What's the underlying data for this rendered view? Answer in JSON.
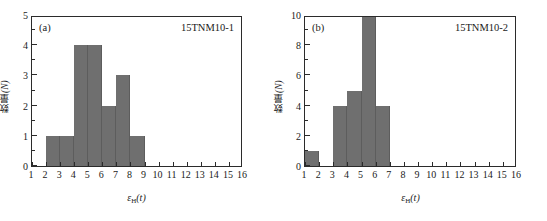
{
  "figure": {
    "background": "#ffffff",
    "bar_color": "#6f6f6f",
    "axis_color": "#2b2b2b"
  },
  "panels": [
    {
      "tag": "(a)",
      "sample_id": "15TNM10-1",
      "ylabel_cjk": "数量",
      "ylabel_unit": "(N)",
      "xlabel_symbol": "ε",
      "xlabel_sub": "H",
      "xlabel_arg": "(t)"
    },
    {
      "tag": "(b)",
      "sample_id": "15TNM10-2",
      "ylabel_cjk": "数量",
      "ylabel_unit": "(N)",
      "xlabel_symbol": "ε",
      "xlabel_sub": "H",
      "xlabel_arg": "(t)"
    }
  ],
  "chart_data": [
    {
      "type": "bar",
      "title": "15TNM10-1",
      "panel_label": "(a)",
      "xlabel": "εH(t)",
      "ylabel": "数量(N)",
      "xlim": [
        1,
        16
      ],
      "ylim": [
        0,
        5
      ],
      "xticks": [
        1,
        2,
        3,
        4,
        5,
        6,
        7,
        8,
        9,
        10,
        11,
        12,
        13,
        14,
        15,
        16
      ],
      "yticks": [
        0,
        1,
        2,
        3,
        4,
        5
      ],
      "y_minor_ticks": [
        0.5,
        1.5,
        2.5,
        3.5,
        4.5
      ],
      "grid": false,
      "legend": false,
      "bin_edges": [
        2,
        3,
        4,
        5,
        6,
        7,
        8,
        9
      ],
      "bin_labels": [
        "2-3",
        "3-4",
        "4-5",
        "5-6",
        "6-7",
        "7-8",
        "8-9"
      ],
      "values": [
        1,
        1,
        4,
        4,
        2,
        3,
        1
      ],
      "total_count": 16
    },
    {
      "type": "bar",
      "title": "15TNM10-2",
      "panel_label": "(b)",
      "xlabel": "εH(t)",
      "ylabel": "数量(N)",
      "xlim": [
        1,
        16
      ],
      "ylim": [
        0,
        10
      ],
      "xticks": [
        1,
        2,
        3,
        4,
        5,
        6,
        7,
        8,
        9,
        10,
        11,
        12,
        13,
        14,
        15,
        16
      ],
      "yticks": [
        0,
        2,
        4,
        6,
        8,
        10
      ],
      "y_minor_ticks": [
        1,
        3,
        5,
        7,
        9
      ],
      "grid": false,
      "legend": false,
      "bin_edges": [
        1,
        2,
        3,
        4,
        5,
        6,
        7
      ],
      "bin_labels": [
        "1-2",
        "3-4",
        "4-5",
        "5-6",
        "6-7"
      ],
      "bars": [
        {
          "x0": 1,
          "x1": 2,
          "value": 1
        },
        {
          "x0": 3,
          "x1": 4,
          "value": 4
        },
        {
          "x0": 4,
          "x1": 5,
          "value": 5
        },
        {
          "x0": 5,
          "x1": 6,
          "value": 10
        },
        {
          "x0": 6,
          "x1": 7,
          "value": 4
        }
      ],
      "total_count": 24
    }
  ]
}
